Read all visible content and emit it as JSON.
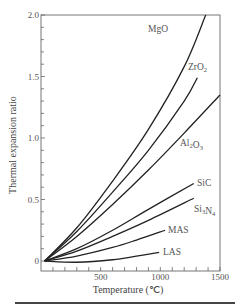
{
  "chart_data": {
    "type": "line",
    "title": "",
    "xlabel": "Temperature (℃)",
    "ylabel": "Thermal expansion ratio",
    "xlim": [
      0,
      1500
    ],
    "ylim": [
      0,
      2.0
    ],
    "x_ticks": [
      500,
      1000,
      1500
    ],
    "x_tick_labels": [
      "500",
      "1000",
      "1500"
    ],
    "x_minor_step": 100,
    "y_ticks": [
      0,
      0.5,
      1.0,
      1.5,
      2.0
    ],
    "y_tick_labels": [
      "0",
      "0.5",
      "1.0",
      "1.5",
      "2.0"
    ],
    "y_minor_step": 0.1,
    "grid": false,
    "legend": "inline labels at curve ends",
    "series": [
      {
        "name": "MgO",
        "label_sub": "",
        "x": [
          30,
          300,
          600,
          900,
          1200,
          1380
        ],
        "y": [
          0,
          0.27,
          0.65,
          1.07,
          1.58,
          2.0
        ]
      },
      {
        "name": "ZrO2",
        "label_sub": "2",
        "x": [
          30,
          300,
          600,
          900,
          1200,
          1310
        ],
        "y": [
          0,
          0.24,
          0.56,
          0.9,
          1.3,
          1.49
        ]
      },
      {
        "name": "Al2O3",
        "label_sub": "2,3",
        "x": [
          30,
          300,
          600,
          900,
          1200,
          1500
        ],
        "y": [
          0,
          0.2,
          0.46,
          0.74,
          1.04,
          1.35
        ]
      },
      {
        "name": "SiC",
        "label_sub": "",
        "x": [
          30,
          300,
          600,
          900,
          1280
        ],
        "y": [
          0,
          0.1,
          0.25,
          0.42,
          0.63
        ]
      },
      {
        "name": "Si3N4",
        "label_sub": "3,4",
        "x": [
          30,
          300,
          600,
          900,
          1280
        ],
        "y": [
          0,
          0.08,
          0.2,
          0.33,
          0.51
        ]
      },
      {
        "name": "MAS",
        "label_sub": "",
        "x": [
          30,
          300,
          600,
          800,
          1040
        ],
        "y": [
          0,
          0.04,
          0.11,
          0.17,
          0.25
        ]
      },
      {
        "name": "LAS",
        "label_sub": "",
        "x": [
          30,
          300,
          600,
          800,
          990
        ],
        "y": [
          0,
          -0.01,
          0.01,
          0.04,
          0.07
        ]
      }
    ],
    "labels": [
      {
        "text": "MgO",
        "x": 148,
        "y": 32
      },
      {
        "text": "ZrO",
        "sub": "2",
        "x": 188,
        "y": 70
      },
      {
        "text": "Al",
        "sub1": "2",
        "mid": "O",
        "sub2": "3",
        "x": 180,
        "y": 146
      },
      {
        "text": "SiC",
        "x": 197,
        "y": 186
      },
      {
        "text": "Si",
        "sub1": "3",
        "mid": "N",
        "sub2": "4",
        "x": 194,
        "y": 212
      },
      {
        "text": "MAS",
        "x": 168,
        "y": 233
      },
      {
        "text": "LAS",
        "x": 163,
        "y": 255
      }
    ]
  }
}
